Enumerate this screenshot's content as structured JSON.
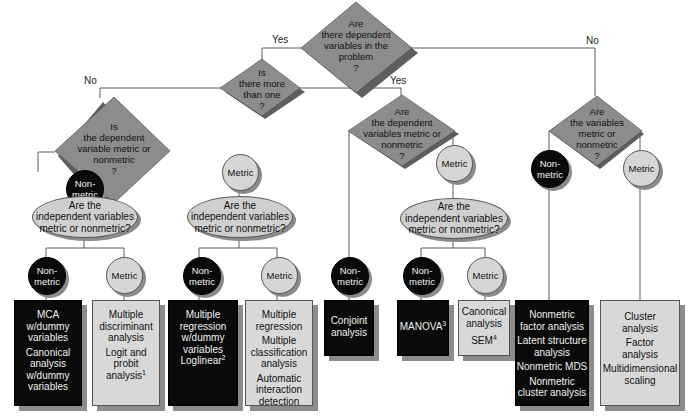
{
  "diagram": {
    "root": {
      "text": [
        "Are",
        "there dependent",
        "variables in the",
        "problem",
        "?"
      ]
    },
    "edge_labels": {
      "root_yes": "Yes",
      "root_no": "No",
      "more_no": "No",
      "more_yes": "Yes"
    },
    "q_more_than_one": {
      "text": [
        "Is",
        "there more",
        "than one",
        "?"
      ]
    },
    "q_single_dep": {
      "text": [
        "Is",
        "the dependent",
        "variable metric or",
        "nonmetric",
        "?"
      ]
    },
    "q_multi_dep": {
      "text": [
        "Are",
        "the dependent",
        "variables metric or",
        "nonmetric",
        "?"
      ]
    },
    "q_interdep": {
      "text": [
        "Are",
        "the variables",
        "metric or",
        "nonmetric",
        "?"
      ]
    },
    "nodes": {
      "nonmetric": "Non-\nmetric",
      "nonmetric_l1": "Non-",
      "nonmetric_l2": "metric",
      "metric": "Metric"
    },
    "independent_question": {
      "line1": "Are the",
      "line2": "independent variables",
      "line3": "metric or nonmetric?"
    },
    "techniques": {
      "single_nonmetric_nonmetric": [
        "MCA",
        "w/dummy",
        "variables",
        "Canonical",
        "analysis",
        "w/dummy",
        "variables"
      ],
      "single_nonmetric_metric": [
        "Multiple",
        "discriminant",
        "analysis",
        "Logit and",
        "probit",
        "analysis"
      ],
      "single_nonmetric_metric_footnote": "1",
      "single_metric_nonmetric": [
        "Multiple",
        "regression",
        "w/dummy",
        "variables",
        "Loglinear"
      ],
      "single_metric_nonmetric_footnote": "2",
      "single_metric_metric": [
        "Multiple",
        "regression",
        "Multiple",
        "classification",
        "analysis",
        "Automatic",
        "interaction",
        "detection"
      ],
      "multi_nonmetric": [
        "Conjoint",
        "analysis"
      ],
      "multi_metric_nonmetric": "MANOVA",
      "multi_metric_nonmetric_footnote": "3",
      "multi_metric_metric": [
        "Canonical",
        "analysis",
        "SEM"
      ],
      "multi_metric_metric_footnote": "4",
      "interdep_nonmetric": [
        "Nonmetric",
        "factor analysis",
        "Latent structure",
        "analysis",
        "Nonmetric MDS",
        "Nonmetric",
        "cluster analysis"
      ],
      "interdep_metric": [
        "Cluster",
        "analysis",
        "Factor",
        "analysis",
        "Multidimensional",
        "scaling"
      ]
    },
    "colors": {
      "diamond_fill": "#8c8c8c",
      "diamond_shadow": "#5e5e5e",
      "dark_fill": "#0a0a0a",
      "light_fill": "#d6d6d6",
      "shadow": "#8a8a8a",
      "line": "#555555"
    }
  }
}
